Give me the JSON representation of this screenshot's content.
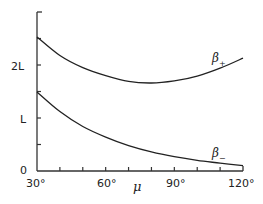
{
  "chart_data": {
    "type": "line",
    "title": "",
    "xlabel": "μ",
    "ylabel": "",
    "xlim": [
      30,
      120
    ],
    "ylim": [
      0,
      3
    ],
    "x_ticks": [
      "30°",
      "60°",
      "90°",
      "120°"
    ],
    "y_ticks": [
      "0",
      "L",
      "2L"
    ],
    "grid": false,
    "legend": "inline labels",
    "x": [
      30,
      40,
      50,
      60,
      70,
      80,
      90,
      100,
      110,
      120
    ],
    "series": [
      {
        "name": "β+",
        "label_main": "β",
        "label_sub": "+",
        "values": [
          2.53,
          2.18,
          1.95,
          1.8,
          1.69,
          1.66,
          1.7,
          1.79,
          1.94,
          2.13
        ]
      },
      {
        "name": "β−",
        "label_main": "β",
        "label_sub": "−",
        "values": [
          1.49,
          1.12,
          0.84,
          0.64,
          0.48,
          0.36,
          0.27,
          0.2,
          0.15,
          0.1
        ]
      }
    ],
    "units": "y values in units of L"
  }
}
